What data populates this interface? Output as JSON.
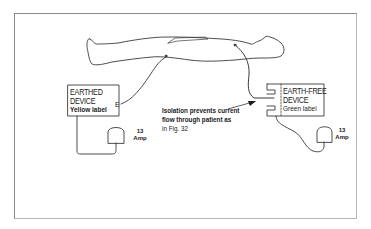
{
  "figure": {
    "type": "electrical safety diagram"
  },
  "earthed_device": {
    "title_line1": "EARTHED",
    "title_line2": "DEVICE",
    "label": "Yellow label",
    "terminal": "E",
    "plug_rating_value": "13",
    "plug_rating_unit": "Amp"
  },
  "earth_free_device": {
    "title_line1": "EARTH-FREE",
    "title_line2": "DEVICE",
    "label": "Green label",
    "plug_rating_value": "13",
    "plug_rating_unit": "Amp"
  },
  "annotation": {
    "line1": "Isolation prevents current",
    "line2": "flow through patient as",
    "line3": "in Fig. 32"
  },
  "colors": {
    "line": "#333333",
    "frame": "#8a8a8a",
    "background": "#ffffff"
  }
}
